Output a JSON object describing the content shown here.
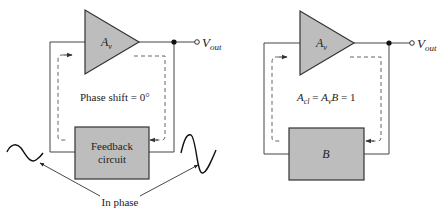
{
  "colors": {
    "block_fill": "#bdbdbd",
    "block_stroke": "#333333",
    "wire": "#444444",
    "dashed": "#555555",
    "text": "#222222",
    "background": "#ffffff"
  },
  "left_diagram": {
    "amplifier_label": "A",
    "amplifier_subscript": "v",
    "output_label": "V",
    "output_subscript": "out",
    "phase_text": "Phase shift = 0°",
    "feedback_line1": "Feedback",
    "feedback_line2": "circuit",
    "in_phase_label": "In phase"
  },
  "right_diagram": {
    "amplifier_label": "A",
    "amplifier_subscript": "v",
    "output_label": "V",
    "output_subscript": "out",
    "equation": {
      "lhs": "A",
      "lhs_sub": "cl",
      "eq1": " = ",
      "mid": "A",
      "mid_sub": "v",
      "mid2": "B",
      "rest": " = 1"
    },
    "feedback_label": "B"
  }
}
